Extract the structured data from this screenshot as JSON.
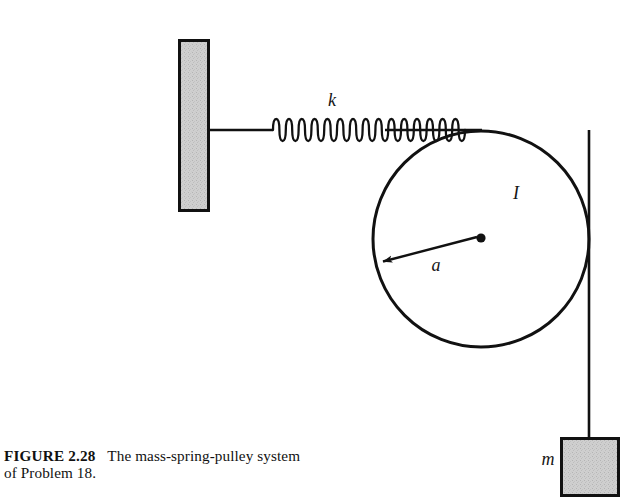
{
  "figure": {
    "label": "FIGURE 2.28",
    "caption": "The mass-spring-pulley system of Problem 18.",
    "caption_line1": "The mass-spring-",
    "caption_line2": "pulley system of Problem 18."
  },
  "diagram": {
    "title": "mass-spring-pulley system",
    "labels": {
      "spring_constant": "k",
      "pulley_inertia": "I",
      "pulley_radius": "a",
      "hanging_mass": "m"
    },
    "colors": {
      "stroke": "#111111",
      "block_fill": "#cccccc",
      "background": "#ffffff"
    },
    "components": [
      {
        "name": "wall",
        "type": "hatched-block",
        "x": 179,
        "y": 40,
        "width": 30,
        "height": 171
      },
      {
        "name": "wall-connector-rod",
        "type": "line",
        "x1": 209,
        "y1": 130,
        "x2": 272,
        "y2": 130
      },
      {
        "name": "spring",
        "type": "coil",
        "x1": 272,
        "y1": 130,
        "x2": 386,
        "y2": 130,
        "coils": 18,
        "amplitude": 11
      },
      {
        "name": "spring-to-pulley-cord",
        "type": "line",
        "x1": 386,
        "y1": 130,
        "x2": 481,
        "y2": 130
      },
      {
        "name": "pulley",
        "type": "circle",
        "cx": 481,
        "cy": 239,
        "r": 108
      },
      {
        "name": "pulley-center",
        "type": "dot",
        "cx": 481,
        "cy": 238,
        "r": 4.5
      },
      {
        "name": "radius-arrow",
        "type": "arrow",
        "x1": 477,
        "y1": 237,
        "x2": 381,
        "y2": 262
      },
      {
        "name": "hanging-cord",
        "type": "line",
        "x1": 589,
        "y1": 130,
        "x2": 589,
        "y2": 438
      },
      {
        "name": "mass-block",
        "type": "hatched-block",
        "x": 561,
        "y": 438,
        "width": 58,
        "height": 57
      }
    ]
  }
}
